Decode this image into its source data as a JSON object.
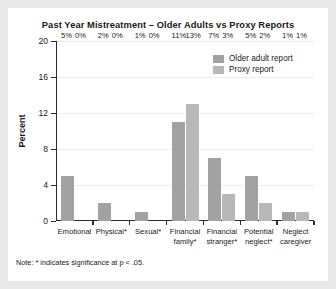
{
  "figure": {
    "title": "Past Year Mistreatment – Older Adults vs Proxy Reports",
    "footnote": "Note: * indicates significance at p < .05.",
    "background_color": "#ffffff",
    "page_background_color": "#e9e9e9"
  },
  "chart_data": {
    "type": "bar",
    "title": "Past Year Mistreatment – Older Adults vs Proxy Reports",
    "xlabel": "",
    "ylabel": "Percent",
    "categories": [
      "Emotional",
      "Physical*",
      "Sexual*",
      "Financial\nfamily*",
      "Financial\nstranger*",
      "Potential\nneglect*",
      "Neglect\ncaregiver"
    ],
    "series": [
      {
        "name": "Older adult report",
        "color": "#a2a2a2",
        "values": [
          5,
          2,
          1,
          11,
          7,
          5,
          1
        ],
        "labels": [
          "5%",
          "2%",
          "1%",
          "11%",
          "7%",
          "5%",
          "1%"
        ]
      },
      {
        "name": "Proxy report",
        "color": "#b8b8b8",
        "values": [
          0,
          0,
          0,
          13,
          3,
          2,
          1
        ],
        "labels": [
          "0%",
          "0%",
          "0%",
          "13%",
          "3%",
          "2%",
          "1%"
        ]
      }
    ],
    "ylim": [
      0,
      20
    ],
    "yticks": [
      0,
      4,
      8,
      12,
      16,
      20
    ],
    "ytick_labels": [
      "0",
      "4",
      "8",
      "12",
      "16",
      "20"
    ],
    "grid": true,
    "legend_position": "top-right"
  }
}
